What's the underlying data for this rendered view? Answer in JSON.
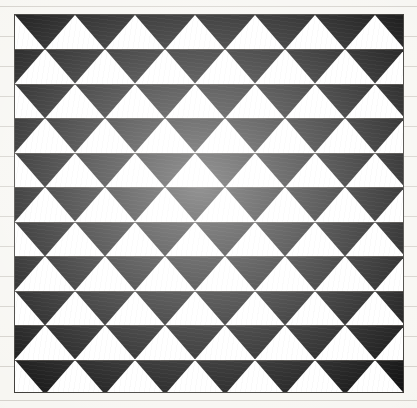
{
  "page": {
    "width": 417,
    "height": 408,
    "background_color": "#f7f6f2",
    "caption": ""
  },
  "ruled_lines": {
    "name": "faint-horizontal-ruled-lines",
    "color": "#beba b2",
    "stroke_color": "#bebab2",
    "opacity": 0.6,
    "y_positions": [
      6,
      36,
      66,
      96,
      126,
      156,
      186,
      216,
      246,
      276,
      306,
      336,
      366,
      400
    ]
  },
  "figure": {
    "title": "Black and white triangular tessellation",
    "frame": {
      "x": 14,
      "y": 14,
      "width": 390,
      "height": 379,
      "border_color": "#3c3a36",
      "border_width": 1
    },
    "pattern": {
      "type": "alternating-triangle-tessellation",
      "ink_color": "#111111",
      "paper_color": "#ffffff",
      "rows": 11,
      "columns": 6.5,
      "cell_width": 60,
      "row_height": 34.45,
      "triangle_direction": "down",
      "row_offset_alternating": true,
      "row_offset_px": 30,
      "band_rule_color": "#45423d"
    }
  }
}
